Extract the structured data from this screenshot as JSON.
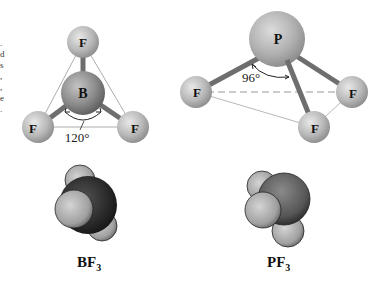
{
  "left_edge_fragments": [
    ".",
    "d",
    "s",
    ",",
    ",",
    "e",
    "."
  ],
  "bf3": {
    "central_atom": "B",
    "ligands": [
      "F",
      "F",
      "F"
    ],
    "bond_angle": "120°",
    "caption_main": "BF",
    "caption_sub": "3"
  },
  "pf3": {
    "central_atom": "P",
    "ligands": [
      "F",
      "F",
      "F"
    ],
    "bond_angle": "96°",
    "caption_main": "PF",
    "caption_sub": "3"
  },
  "colors": {
    "ligand_sphere": "#b8b8b8",
    "central_sphere": "#8a8a8a",
    "bond": "#6e6e6e",
    "outline": "#888888",
    "spacefill_dark": "#333333",
    "spacefill_pf_p": "#5c5c5c"
  }
}
